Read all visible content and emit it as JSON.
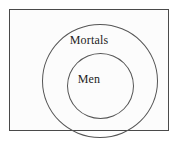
{
  "diagram": {
    "type": "euler-diagram",
    "title": "",
    "universe": {
      "shape": "rectangle",
      "label": "",
      "border_color": "#4a4a4a",
      "fill_color": "#fcfcfc"
    },
    "background_color": "#ffffff",
    "stroke_color": "#555555",
    "text_color": "#1c1c1c",
    "sets": [
      {
        "id": "mortals",
        "label": "Mortals",
        "shape": "circle",
        "level": 0,
        "contains": "men"
      },
      {
        "id": "men",
        "label": "Men",
        "shape": "circle",
        "level": 1,
        "contains": null
      }
    ]
  }
}
